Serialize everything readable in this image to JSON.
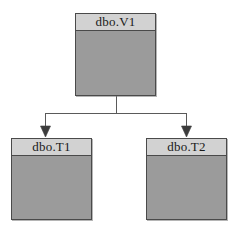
{
  "diagram": {
    "type": "database-dependency-diagram",
    "canvas": {
      "width": 233,
      "height": 227,
      "background": "#ffffff"
    },
    "style": {
      "node_header_fill": "#d2d2d2",
      "node_body_fill": "#9b9b9b",
      "node_border": "#4a4a4a",
      "connector_color": "#5a5a5a",
      "text_color": "#1a1a1a"
    },
    "nodes": [
      {
        "id": "view",
        "label": "dbo.V1",
        "role": "parent",
        "x": 75,
        "y": 13,
        "width": 81,
        "height": 83
      },
      {
        "id": "table_1",
        "label": "dbo.T1",
        "role": "child",
        "x": 11,
        "y": 138,
        "width": 81,
        "height": 82
      },
      {
        "id": "table_2",
        "label": "dbo.T2",
        "role": "child",
        "x": 146,
        "y": 138,
        "width": 81,
        "height": 82
      }
    ],
    "edges": [
      {
        "from": "view",
        "to": "table_1",
        "arrow": "down",
        "style": "orthogonal"
      },
      {
        "from": "view",
        "to": "table_2",
        "arrow": "down",
        "style": "orthogonal"
      }
    ]
  }
}
